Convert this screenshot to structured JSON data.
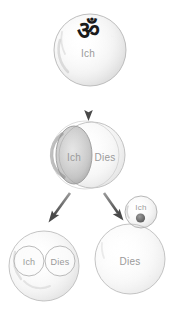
{
  "figure": {
    "background_color": "#ffffff",
    "ink_color": "#b7b7b7",
    "label_color": "#9a9a9a",
    "symbol_color": "#1a1a1a",
    "shading_color": "#a9a9a9",
    "arrow_color": "#6b6b6b"
  },
  "symbols": {
    "om": "ॐ"
  },
  "stages": {
    "stage1": {
      "circle_self": {
        "label": "Ich"
      }
    },
    "stage2": {
      "circle_self": {
        "label": "Ich"
      },
      "circle_object": {
        "label": "Dies"
      }
    },
    "stage3_left": {
      "circle_self": {
        "label": "Ich"
      },
      "circle_object": {
        "label": "Dies"
      }
    },
    "stage3_right": {
      "circle_self": {
        "label": "Ich"
      },
      "circle_object": {
        "label": "Dies"
      }
    }
  },
  "arrows": {
    "arrow_down": {
      "direction": "down"
    },
    "arrow_down_left": {
      "direction": "down-left"
    },
    "arrow_down_right": {
      "direction": "down-right"
    }
  }
}
